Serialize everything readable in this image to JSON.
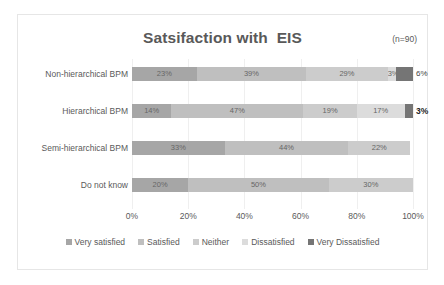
{
  "chart_data": {
    "type": "bar",
    "subtype": "stacked-horizontal-100",
    "title": "Satsifaction with  EIS",
    "annotation": "(n=90)",
    "xlabel": "",
    "ylabel": "",
    "xlim": [
      0,
      100
    ],
    "grid": true,
    "legend_position": "bottom",
    "categories": [
      "Non-hierarchical BPM",
      "Hierarchical BPM",
      "Semi-hierarchical BPM",
      "Do not know"
    ],
    "series": [
      {
        "name": "Very satisfied",
        "color": "#a6a6a6",
        "values": [
          23,
          14,
          33,
          20
        ]
      },
      {
        "name": "Satisfied",
        "color": "#bfbfbf",
        "values": [
          39,
          47,
          44,
          50
        ]
      },
      {
        "name": "Neither",
        "color": "#cccccc",
        "values": [
          29,
          19,
          22,
          30
        ]
      },
      {
        "name": "Dissatisfied",
        "color": "#dcdcdc",
        "values": [
          3,
          17,
          0,
          0
        ]
      },
      {
        "name": "Very Dissatisfied",
        "color": "#757575",
        "values": [
          6,
          3,
          0,
          0
        ]
      }
    ],
    "tick_labels": [
      "0%",
      "20%",
      "40%",
      "60%",
      "80%",
      "100%"
    ],
    "tick_values": [
      0,
      20,
      40,
      60,
      80,
      100
    ],
    "bar_labels": [
      [
        "23%",
        "39%",
        "29%",
        "3%",
        "6%"
      ],
      [
        "14%",
        "47%",
        "19%",
        "17%",
        "3%"
      ],
      [
        "33%",
        "44%",
        "22%",
        "",
        ""
      ],
      [
        "20%",
        "50%",
        "30%",
        "",
        ""
      ]
    ],
    "outside_labels": [
      {
        "row": 0,
        "text": "6%",
        "bold": false
      },
      {
        "row": 1,
        "text": "3%",
        "bold": true
      }
    ]
  },
  "colors": {
    "title": "#595959",
    "text": "#5a5a5a",
    "gridline": "#efefef",
    "frame_border": "#e6e6e6",
    "background": "#ffffff"
  }
}
